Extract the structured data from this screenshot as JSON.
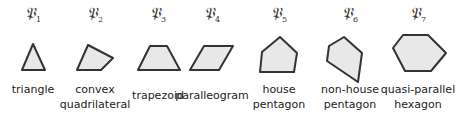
{
  "figure": {
    "items": [
      {
        "symbol": "𝔓",
        "index": "1",
        "label_lines": [
          "triangle"
        ],
        "cx": 33,
        "label_top": 82,
        "points": "33,44 45,70 22,70"
      },
      {
        "symbol": "𝔓",
        "index": "2",
        "label_lines": [
          "convex",
          "quadrilateral"
        ],
        "cx": 95,
        "label_top": 82,
        "points": "88,45 113,58 101,70 77,70"
      },
      {
        "symbol": "𝔓",
        "index": "3",
        "label_lines": [
          "trapezoid"
        ],
        "cx": 158,
        "label_top": 88,
        "points": "150,46 167,46 180,70 138,70"
      },
      {
        "symbol": "𝔓",
        "index": "4",
        "label_lines": [
          "paralleogram"
        ],
        "cx": 212,
        "label_top": 88,
        "points": "204,46 233,46 219,70 190,70"
      },
      {
        "symbol": "𝔓",
        "index": "5",
        "label_lines": [
          "house",
          "pentagon"
        ],
        "cx": 279,
        "label_top": 82,
        "points": "280,37 297,53 294,72 260,72 262,52"
      },
      {
        "symbol": "𝔓",
        "index": "6",
        "label_lines": [
          "non-house",
          "pentagon"
        ],
        "cx": 350,
        "label_top": 82,
        "points": "344,37 362,53 358,82 327,61 329,46"
      },
      {
        "symbol": "𝔓",
        "index": "7",
        "label_lines": [
          "quasi-parallel",
          "hexagon"
        ],
        "cx": 418,
        "label_top": 82,
        "points": "403,35 428,35 446,53 431,71 405,71 393,48"
      }
    ]
  }
}
